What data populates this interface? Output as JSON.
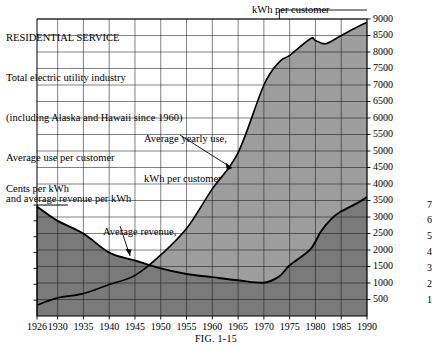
{
  "header": {
    "lines": [
      "RESIDENTIAL SERVICE",
      "Total electric utility industry",
      "(including Alaska and Hawaii since 1960)",
      "Average use per customer",
      "and average revenue per kWh"
    ]
  },
  "labels": {
    "right_axis_title": "kWh per customer",
    "left_axis_title": "Cents per kWh",
    "annotation_use": [
      "Average yearly use,",
      "kWh per customer"
    ],
    "annotation_revenue": [
      "Average revenue,",
      "cents per kWh"
    ],
    "figure_caption": "FIG. 1-15"
  },
  "chart_data": {
    "type": "area",
    "title": "RESIDENTIAL SERVICE",
    "xlabel": "",
    "ylabel": "Cents per kWh",
    "y2label": "kWh per customer",
    "grid": true,
    "legend": "annotations",
    "xlim": [
      1926,
      1990
    ],
    "ylim_left": [
      0,
      7
    ],
    "ylim_right": [
      0,
      9000
    ],
    "xticks": [
      1926,
      1930,
      1935,
      1940,
      1945,
      1950,
      1955,
      1960,
      1965,
      1970,
      1975,
      1980,
      1985,
      1990
    ],
    "yticks_left": [
      1,
      2,
      3,
      4,
      5,
      6,
      7
    ],
    "yticks_right": [
      500,
      1000,
      1500,
      2000,
      2500,
      3000,
      3500,
      4000,
      4500,
      5000,
      5500,
      6000,
      6500,
      7000,
      7500,
      8000,
      8500,
      9000
    ],
    "series": [
      {
        "name": "Average yearly use, kWh per customer",
        "axis": "right",
        "x": [
          1926,
          1930,
          1935,
          1940,
          1945,
          1950,
          1955,
          1960,
          1965,
          1970,
          1973,
          1975,
          1979,
          1980,
          1982,
          1985,
          1988,
          1990
        ],
        "values": [
          330,
          550,
          680,
          950,
          1230,
          1850,
          2650,
          3850,
          4950,
          7000,
          7700,
          7900,
          8400,
          8350,
          8250,
          8500,
          8750,
          8900
        ]
      },
      {
        "name": "Average revenue, cents per kWh",
        "axis": "left",
        "x": [
          1926,
          1930,
          1935,
          1940,
          1945,
          1950,
          1955,
          1960,
          1965,
          1970,
          1973,
          1975,
          1979,
          1981,
          1983,
          1985,
          1988,
          1990
        ],
        "values": [
          6.9,
          6.0,
          5.2,
          4.0,
          3.5,
          3.0,
          2.65,
          2.45,
          2.25,
          2.1,
          2.5,
          3.2,
          4.2,
          5.3,
          6.1,
          6.6,
          7.1,
          7.5
        ]
      }
    ]
  }
}
